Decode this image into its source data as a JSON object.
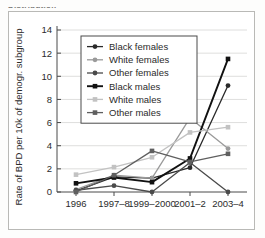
{
  "figure": {
    "clipped_caption": "Distribution"
  },
  "chart_data": {
    "type": "line",
    "title": "",
    "xlabel": "",
    "ylabel": "Rate of BPD per 10k of demogr. subgroup",
    "categories": [
      "1996",
      "1997–8",
      "1999–2000",
      "2001–2",
      "2003–4"
    ],
    "ylim": [
      0,
      14
    ],
    "yticks": [
      0,
      2,
      4,
      6,
      8,
      10,
      12,
      14
    ],
    "ytick_labels": [
      "0",
      "2",
      "4",
      "6",
      "8",
      "10",
      "12",
      "14"
    ],
    "grid": "horizontal",
    "legend_position": "upper-left-inside",
    "series": [
      {
        "name": "Black females",
        "values": [
          0.1,
          1.3,
          1.2,
          2.1,
          9.2
        ],
        "color": "#2a2a2a",
        "marker": "circle",
        "line_width": 1.3
      },
      {
        "name": "White females",
        "values": [
          0.2,
          1.45,
          1.2,
          6.4,
          3.75
        ],
        "color": "#9a9a9a",
        "marker": "circle",
        "line_width": 1.3
      },
      {
        "name": "Other females",
        "values": [
          0.15,
          0.55,
          0.0,
          2.55,
          0.0
        ],
        "color": "#4a4a4a",
        "marker": "circle",
        "line_width": 1.3
      },
      {
        "name": "Black males",
        "values": [
          0.75,
          1.25,
          0.85,
          2.9,
          11.5
        ],
        "color": "#111111",
        "marker": "square",
        "line_width": 1.9
      },
      {
        "name": "White males",
        "values": [
          1.5,
          2.15,
          3.0,
          5.15,
          5.6
        ],
        "color": "#c2c2c2",
        "marker": "square",
        "line_width": 1.3
      },
      {
        "name": "Other males",
        "values": [
          0.0,
          1.45,
          3.55,
          2.6,
          3.3
        ],
        "color": "#5f5f5f",
        "marker": "square",
        "line_width": 1.3
      }
    ]
  }
}
